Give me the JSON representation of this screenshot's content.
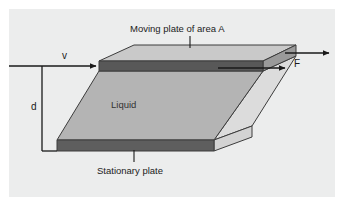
{
  "figure": {
    "title_alt": "Viscous shear of a liquid layer between a moving plate and a stationary plate",
    "panel_bg": "#eceded",
    "page_bg": "#ffffff"
  },
  "labels": {
    "moving_plate": "Moving plate of area A",
    "stationary_plate": "Stationary plate",
    "liquid": "Liquid",
    "velocity": "v",
    "thickness": "d",
    "force": "F"
  },
  "colors": {
    "top_plate_top_face": "#c9c9c9",
    "top_plate_front_face": "#585858",
    "top_plate_side_face": "#9a9a9a",
    "bottom_plate_front_face": "#5e5e5e",
    "bottom_plate_top_face": "#8f8f8f",
    "bottom_plate_side_face": "#d3d3d3",
    "liquid_front_face": "#b4b4b4",
    "liquid_side_face": "#dcdcdc",
    "outline": "#3c3c3c",
    "arrow": "#1a1a1a",
    "text": "#222222"
  },
  "geometry": {
    "panel": {
      "x": 9,
      "y": 9,
      "width": 326,
      "height": 188
    },
    "top_plate": {
      "front_top_left": [
        99,
        61
      ],
      "front_top_right": [
        263,
        61
      ],
      "front_bottom_left": [
        99,
        71
      ],
      "front_bottom_right": [
        263,
        71
      ],
      "back_left": [
        134,
        45
      ],
      "back_right": [
        296,
        45
      ]
    },
    "bottom_plate": {
      "front_top_left": [
        57,
        140
      ],
      "front_top_right": [
        214,
        140
      ],
      "front_bottom_left": [
        57,
        151
      ],
      "front_bottom_right": [
        214,
        151
      ],
      "back_right": [
        252,
        126
      ]
    },
    "liquid": {
      "top_left": [
        99,
        71
      ],
      "top_right": [
        263,
        71
      ],
      "bottom_right": [
        214,
        140
      ],
      "bottom_left": [
        57,
        140
      ]
    }
  },
  "annotations": {
    "velocity_arrow": {
      "from": [
        8,
        66
      ],
      "to": [
        99,
        66
      ]
    },
    "force_arrow_upper": {
      "from": [
        263,
        53
      ],
      "to": [
        330,
        53
      ]
    },
    "force_arrow_lower": {
      "from": [
        214,
        68
      ],
      "to": [
        286,
        68
      ]
    },
    "thickness_line": {
      "top": [
        42,
        66
      ],
      "bottom": [
        42,
        151
      ]
    },
    "moving_plate_leader": {
      "top": [
        190,
        37
      ],
      "bottom": [
        190,
        49
      ]
    },
    "stationary_plate_leader": {
      "top": [
        134,
        149
      ],
      "bottom": [
        134,
        161
      ]
    }
  }
}
